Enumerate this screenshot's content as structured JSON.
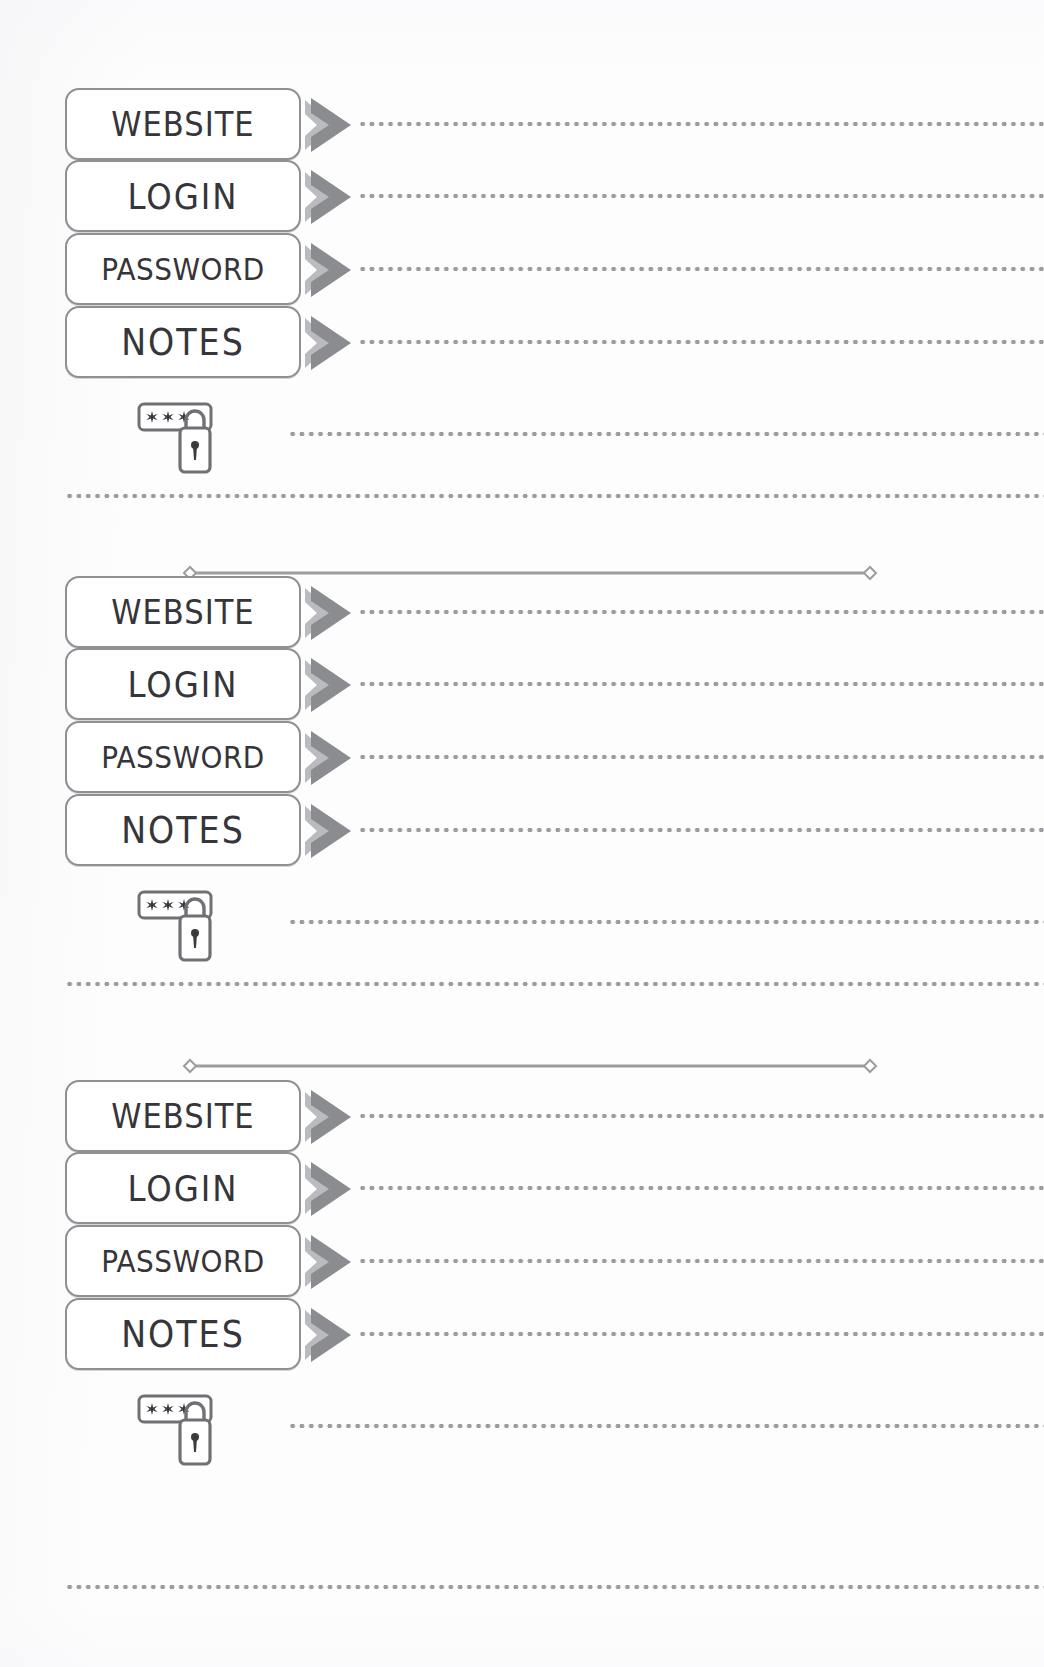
{
  "page": {
    "kind": "password-organizer-page",
    "width": 1044,
    "height": 1667,
    "background_color": "#fdfdfd"
  },
  "style": {
    "label_border_color": "#8e9094",
    "label_fill_color": "#ffffff",
    "label_text_color": "#35353a",
    "arrow_color": "#8a8c90",
    "arrow_shadow_color": "#b9bbbf",
    "dot_color": "#9a9ca1",
    "divider_color": "#9b9da1",
    "icon_color": "#6f7175"
  },
  "labels": {
    "website": "WEBSITE",
    "login": "LOGIN",
    "password": "PASSWORD",
    "notes": "NOTES"
  },
  "icons": {
    "arrow": "chevron-right-icon",
    "password_field": "password-asterisks-icon",
    "padlock": "padlock-icon",
    "asterisks": "✻✻✻",
    "divider_tip": "diamond-icon"
  },
  "entries": [
    {
      "id": "entry-1",
      "fields": [
        {
          "name": "website",
          "label": "WEBSITE",
          "value": ""
        },
        {
          "name": "login",
          "label": "LOGIN",
          "value": ""
        },
        {
          "name": "password",
          "label": "PASSWORD",
          "value": ""
        },
        {
          "name": "notes",
          "label": "NOTES",
          "value": ""
        }
      ],
      "extra_line_value": "",
      "footer_line_value": ""
    },
    {
      "id": "entry-2",
      "fields": [
        {
          "name": "website",
          "label": "WEBSITE",
          "value": ""
        },
        {
          "name": "login",
          "label": "LOGIN",
          "value": ""
        },
        {
          "name": "password",
          "label": "PASSWORD",
          "value": ""
        },
        {
          "name": "notes",
          "label": "NOTES",
          "value": ""
        }
      ],
      "extra_line_value": "",
      "footer_line_value": ""
    },
    {
      "id": "entry-3",
      "fields": [
        {
          "name": "website",
          "label": "WEBSITE",
          "value": ""
        },
        {
          "name": "login",
          "label": "LOGIN",
          "value": ""
        },
        {
          "name": "password",
          "label": "PASSWORD",
          "value": ""
        },
        {
          "name": "notes",
          "label": "NOTES",
          "value": ""
        }
      ],
      "extra_line_value": "",
      "footer_line_value": ""
    }
  ]
}
